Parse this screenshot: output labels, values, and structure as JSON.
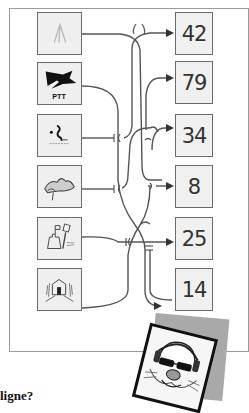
{
  "puzzle": {
    "left_items": [
      {
        "id": "tent",
        "icon": "tent-icon"
      },
      {
        "id": "ptt",
        "icon": "ptt-post-logo-icon",
        "label": "PTT"
      },
      {
        "id": "swimmer",
        "icon": "diving-swimmer-icon"
      },
      {
        "id": "wave",
        "icon": "wave-sea-icon"
      },
      {
        "id": "sandcastle",
        "icon": "sandcastle-icon"
      },
      {
        "id": "house",
        "icon": "house-trees-icon"
      }
    ],
    "right_items": [
      {
        "value": "42"
      },
      {
        "value": "79"
      },
      {
        "value": "34"
      },
      {
        "value": "8"
      },
      {
        "value": "25"
      },
      {
        "value": "14"
      }
    ],
    "question_text": "ligne?",
    "colors": {
      "line": "#555555",
      "box_fill": "#efefef",
      "box_border": "#6b6b6b",
      "shadow": "#a9a9a9"
    }
  }
}
